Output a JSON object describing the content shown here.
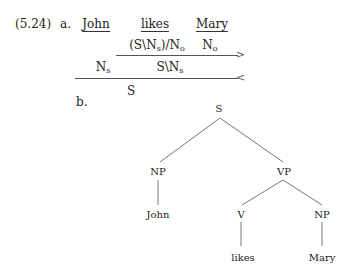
{
  "example": {
    "number": "(5.24)",
    "part_a_label": "a.",
    "part_b_label": "b."
  },
  "derivation": {
    "words": [
      "John",
      "likes",
      "Mary"
    ],
    "row1": {
      "likes_cat": {
        "base": "(S\\N",
        "sub": "s",
        "rest": ")/N",
        "sub2": "o"
      },
      "mary_cat": {
        "base": "N",
        "sub": "o"
      },
      "rule_arrow": ">"
    },
    "row2": {
      "john_cat": {
        "base": "N",
        "sub": "s"
      },
      "result_cat": {
        "base": "S\\N",
        "sub": "s"
      },
      "rule_arrow": "<"
    },
    "row3": {
      "result": "S"
    }
  },
  "tree": {
    "root": "S",
    "np_subject": "NP",
    "vp": "VP",
    "subject_word": "John",
    "verb": "V",
    "np_object": "NP",
    "verb_word": "likes",
    "object_word": "Mary"
  }
}
